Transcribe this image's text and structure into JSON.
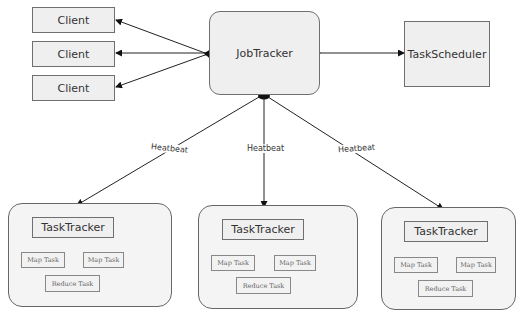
{
  "diagram": {
    "clients": [
      {
        "label": "Client"
      },
      {
        "label": "Client"
      },
      {
        "label": "Client"
      }
    ],
    "job_tracker": {
      "label": "JobTracker"
    },
    "task_scheduler": {
      "label": "TaskScheduler"
    },
    "edges": {
      "heartbeat_labels": [
        "Heatbeat",
        "Heatbeat",
        "Heatbeat"
      ]
    },
    "task_tracker_groups": [
      {
        "tracker": "TaskTracker",
        "map_tasks": [
          "Map Task",
          "Map Task"
        ],
        "reduce_task": "Reduce Task"
      },
      {
        "tracker": "TaskTracker",
        "map_tasks": [
          "Map Task",
          "Map Task"
        ],
        "reduce_task": "Reduce Task"
      },
      {
        "tracker": "TaskTracker",
        "map_tasks": [
          "Map Task",
          "Map Task"
        ],
        "reduce_task": "Reduce Task"
      }
    ],
    "colors": {
      "box_fill": "#efefef",
      "box_border": "#6f6f6f",
      "line": "#222222"
    }
  }
}
